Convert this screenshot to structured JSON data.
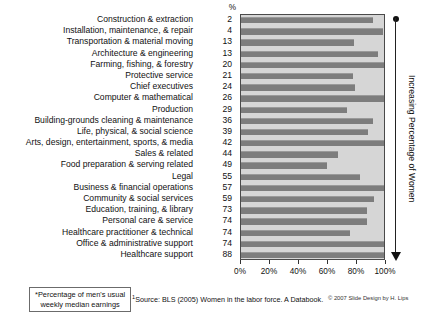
{
  "chart_data": {
    "type": "bar",
    "orientation": "horizontal",
    "title": "",
    "xlabel": "",
    "ylabel": "",
    "xlim": [
      0,
      100
    ],
    "grid": false,
    "legend": null,
    "value_column_header": "%",
    "value_column_note": "Percentage of workers in occupation who are women",
    "bar_note": "Percentage of men's usual weekly median earnings",
    "xticks": [
      "0%",
      "20%",
      "40%",
      "60%",
      "80%",
      "100%"
    ],
    "xtick_values": [
      0,
      20,
      40,
      60,
      80,
      100
    ],
    "categories": [
      "Construction & extraction",
      "Installation, maintenance, & repair",
      "Transportation & material moving",
      "Architecture & engineering",
      "Farming, fishing, & forestry",
      "Protective service",
      "Chief executives",
      "Computer & mathematical",
      "Production",
      "Building-grounds cleaning & maintenance",
      "Life, physical, & social science",
      "Arts, design, entertainment, sports, & media",
      "Sales & related",
      "Food preparation & serving related",
      "Legal",
      "Business & financial operations",
      "Community & social services",
      "Education, training, & library",
      "Personal care & service",
      "Healthcare practitioner & technical",
      "Office & administrative support",
      "Healthcare support"
    ],
    "percent_women": [
      2,
      4,
      13,
      13,
      20,
      21,
      24,
      26,
      29,
      36,
      39,
      42,
      44,
      49,
      55,
      57,
      59,
      73,
      74,
      74,
      74,
      88
    ],
    "values": [
      92,
      99,
      79,
      96,
      100,
      78,
      80,
      100,
      74,
      92,
      89,
      100,
      68,
      60,
      83,
      100,
      93,
      88,
      88,
      76,
      100,
      100
    ]
  },
  "annotation": {
    "vertical_label": "Increasing Percentage of Women",
    "arrow_direction": "down"
  },
  "footnotes": {
    "boxed_note_line1": "*Percentage of men's usual",
    "boxed_note_line2": "weekly median earnings",
    "source_marker": "1",
    "source_text": "Source: BLS (2005) Women in the labor force. A Databook.",
    "copyright": "© 2007 Slide Design by H. Lips"
  },
  "colors": {
    "bar": "#7d7d7d",
    "plot_background": "#d6d6d6",
    "page_background": "#ffffff",
    "text": "#111111"
  }
}
